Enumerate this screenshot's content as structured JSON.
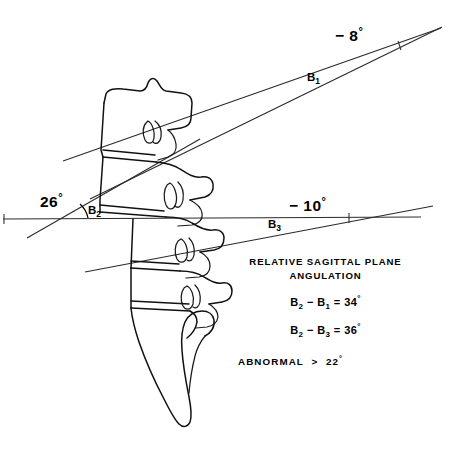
{
  "figure": {
    "type": "anatomical-line-diagram",
    "background_color": "#ffffff",
    "ink_color": "#000000"
  },
  "angle_labels": [
    {
      "id": "b1-angle",
      "value": "− 8",
      "degree": "°",
      "segment": "B",
      "segment_sub": "1"
    },
    {
      "id": "b2-angle",
      "value": "26",
      "degree": "°",
      "segment": "B",
      "segment_sub": "2"
    },
    {
      "id": "b3-angle",
      "value": "− 10",
      "degree": "°",
      "segment": "B",
      "segment_sub": "3"
    }
  ],
  "segment_markers": {
    "b1": {
      "base": "B",
      "sub": "1"
    },
    "b2": {
      "base": "B",
      "sub": "2"
    },
    "b3": {
      "base": "B",
      "sub": "3"
    }
  },
  "notes": {
    "title_line1": "RELATIVE  SAGITTAL  PLANE",
    "title_line2": "ANGULATION",
    "formulas": [
      {
        "left_base": "B",
        "left_sub": "2",
        "operator": "−",
        "right_base": "B",
        "right_sub": "1",
        "equals": "=",
        "result": "34",
        "degree": "°"
      },
      {
        "left_base": "B",
        "left_sub": "2",
        "operator": "−",
        "right_base": "B",
        "right_sub": "3",
        "equals": "=",
        "result": "36",
        "degree": "°"
      }
    ],
    "threshold": {
      "label": "ABNORMAL",
      "comparator": ">",
      "value": "22",
      "degree": "°"
    }
  }
}
